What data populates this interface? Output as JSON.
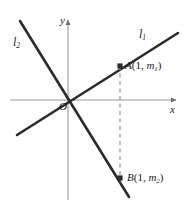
{
  "figure": {
    "type": "coordinate-geometry-diagram",
    "background_color": "#ffffff",
    "axis_color": "#9a9a9a",
    "line_color": "#2b2b2b",
    "dash_color": "#8c8c8c",
    "text_color": "#1a1a1a"
  },
  "axes": {
    "x_label": "x",
    "y_label": "y",
    "origin_label": "O",
    "x_axis": {
      "x1": 10,
      "y1": 100,
      "x2": 176,
      "y2": 100
    },
    "y_axis": {
      "x1": 68,
      "y1": 20,
      "x2": 68,
      "y2": 200
    }
  },
  "lines": [
    {
      "id": "l1",
      "label": "l",
      "label_sub": "1",
      "label_full": "l₁",
      "description": "line through origin with positive slope",
      "x1": 17,
      "y1": 135,
      "x2": 178,
      "y2": 33
    },
    {
      "id": "l2",
      "label": "l",
      "label_sub": "2",
      "label_full": "l₂",
      "description": "line through origin with negative slope",
      "x1": 20,
      "y1": 21,
      "x2": 129,
      "y2": 197
    }
  ],
  "points": [
    {
      "id": "A",
      "name": "A",
      "label_open": "(",
      "label_x": "1",
      "label_sep": ", ",
      "label_m": "m",
      "label_sub": "1",
      "label_close": ")",
      "label_full": "A(1, m₁)",
      "on_line": "l1",
      "x": 120,
      "y": 66
    },
    {
      "id": "B",
      "name": "B",
      "label_open": "(",
      "label_x": "1",
      "label_sep": ", ",
      "label_m": "m",
      "label_sub": "2",
      "label_close": ")",
      "label_full": "B(1, m₂)",
      "on_line": "l2",
      "x": 120,
      "y": 178
    }
  ],
  "dashed_segment": {
    "description": "vertical dashed line from A down to B at x = 1",
    "x": 120,
    "y1": 66,
    "y2": 178
  }
}
